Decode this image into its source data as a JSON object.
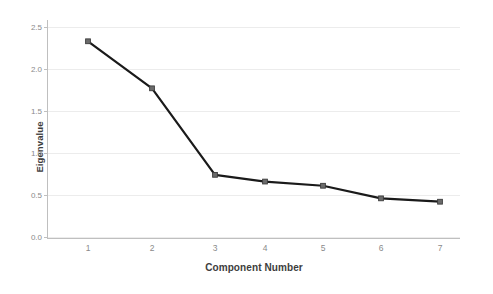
{
  "chart_data": {
    "type": "line",
    "title": "",
    "subtitle": "",
    "xlabel": "Component Number",
    "ylabel": "Eigenvalue",
    "categories": [
      "1",
      "2",
      "3",
      "4",
      "5",
      "6",
      "7"
    ],
    "x": [
      1,
      2,
      3,
      4,
      5,
      6,
      7
    ],
    "values": [
      2.33,
      1.77,
      0.74,
      0.66,
      0.61,
      0.46,
      0.42
    ],
    "series": [
      {
        "name": "Eigenvalue",
        "values": [
          2.33,
          1.77,
          0.74,
          0.66,
          0.61,
          0.46,
          0.42
        ]
      }
    ],
    "xlim": [
      0.5,
      7.5
    ],
    "ylim": [
      0.0,
      2.5
    ],
    "yticks": [
      "0.0",
      "0.5",
      "1.0",
      "1.5",
      "2.0",
      "2.5"
    ],
    "ytick_values": [
      0.0,
      0.5,
      1.0,
      1.5,
      2.0,
      2.5
    ],
    "xticks": [
      "1",
      "2",
      "3",
      "4",
      "5",
      "6",
      "7"
    ],
    "grid": "horizontal",
    "legend": "none",
    "line_color": "#1a1a1a",
    "marker_color": "#6b6b6b",
    "marker_edge_color": "#3c3c3c",
    "gridline_color": "#ececec",
    "axis_color": "#bfbfbf",
    "tick_label_color": "#8a8a8a",
    "axis_title_color": "#3d3d3d",
    "background_color": "#ffffff"
  }
}
